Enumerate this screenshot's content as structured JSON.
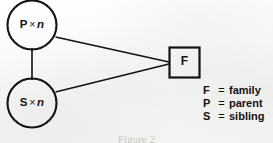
{
  "figure": {
    "caption": "Figure 2",
    "background_color": "#fbfbfa",
    "ink_color": "#15120f"
  },
  "nodes": [
    {
      "id": "parent-node",
      "shape": "circle",
      "symbol": "P",
      "operator": "×",
      "multiplicity": "n",
      "text": "P × n"
    },
    {
      "id": "sibling-node",
      "shape": "circle",
      "symbol": "S",
      "operator": "×",
      "multiplicity": "n",
      "text": "S × n"
    },
    {
      "id": "family-node",
      "shape": "square",
      "symbol": "F",
      "text": "F"
    }
  ],
  "edges": [
    {
      "id": "edge-parent-sibling",
      "from": "parent-node",
      "to": "sibling-node"
    },
    {
      "id": "edge-parent-family",
      "from": "parent-node",
      "to": "family-node"
    },
    {
      "id": "edge-sibling-family",
      "from": "sibling-node",
      "to": "family-node"
    }
  ],
  "legend": {
    "equals": "=",
    "items": [
      {
        "key": "F",
        "value": "family"
      },
      {
        "key": "P",
        "value": "parent"
      },
      {
        "key": "S",
        "value": "sibling"
      }
    ]
  }
}
